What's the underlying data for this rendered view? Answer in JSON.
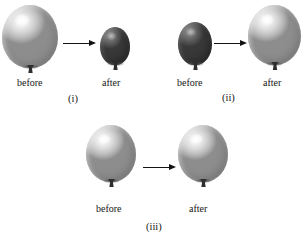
{
  "figure": {
    "background_color": "#ffffff",
    "arrow_color": "#131313",
    "text_color": "#151515",
    "balloon_light_color": "#d2d2d2",
    "balloon_dark_color": "#5a5a5a"
  },
  "panels": [
    {
      "id": "panel-i",
      "label": "(i)",
      "before": {
        "label": "before",
        "state": "inflated",
        "shade": "light",
        "size": "large"
      },
      "after": {
        "label": "after",
        "state": "deflated",
        "shade": "dark",
        "size": "small"
      },
      "arrow": "arrow-right"
    },
    {
      "id": "panel-ii",
      "label": "(ii)",
      "before": {
        "label": "before",
        "state": "deflated",
        "shade": "dark",
        "size": "small"
      },
      "after": {
        "label": "after",
        "state": "inflated",
        "shade": "light",
        "size": "large"
      },
      "arrow": "arrow-right"
    },
    {
      "id": "panel-iii",
      "label": "(iii)",
      "before": {
        "label": "before",
        "state": "inflated",
        "shade": "light",
        "size": "medium"
      },
      "after": {
        "label": "after",
        "state": "inflated",
        "shade": "light",
        "size": "medium"
      },
      "arrow": "arrow-right"
    }
  ]
}
